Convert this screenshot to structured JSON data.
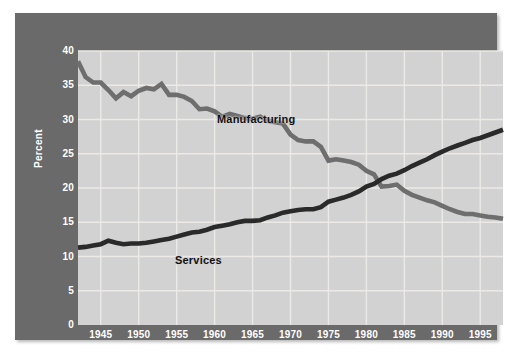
{
  "figure": {
    "background": "#ffffff",
    "frame_color": "#6a6a6a",
    "plot_background": "#d2d2d2",
    "grid_color": "#eceae6"
  },
  "chart_data": {
    "type": "line",
    "title": "",
    "subtitle": "",
    "xlabel": "",
    "ylabel": "Percent",
    "xlim": [
      1942,
      1998
    ],
    "ylim": [
      0,
      40
    ],
    "ytick_values": [
      0,
      5,
      10,
      15,
      20,
      25,
      30,
      35,
      40
    ],
    "ytick_labels": [
      "0",
      "5",
      "10",
      "15",
      "20",
      "25",
      "30",
      "35",
      "40"
    ],
    "xtick_values": [
      1945,
      1950,
      1955,
      1960,
      1965,
      1970,
      1975,
      1980,
      1985,
      1990,
      1995
    ],
    "xtick_labels": [
      "1945",
      "1950",
      "1955",
      "1960",
      "1965",
      "1970",
      "1975",
      "1980",
      "1985",
      "1990",
      "1995"
    ],
    "grid": true,
    "grid_axes": "both",
    "legend": "inline-annotations",
    "annotations": [
      {
        "text": "Manufacturing",
        "x": 1954,
        "y": 35.2
      },
      {
        "text": "Services",
        "x": 1947,
        "y": 14.6
      }
    ],
    "x": [
      1942,
      1943,
      1944,
      1945,
      1946,
      1947,
      1948,
      1949,
      1950,
      1951,
      1952,
      1953,
      1954,
      1955,
      1956,
      1957,
      1958,
      1959,
      1960,
      1961,
      1962,
      1963,
      1964,
      1965,
      1966,
      1967,
      1968,
      1969,
      1970,
      1971,
      1972,
      1973,
      1974,
      1975,
      1976,
      1977,
      1978,
      1979,
      1980,
      1981,
      1982,
      1983,
      1984,
      1985,
      1986,
      1987,
      1988,
      1989,
      1990,
      1991,
      1992,
      1993,
      1994,
      1995,
      1996,
      1997,
      1998
    ],
    "series": [
      {
        "name": "Manufacturing",
        "color": "#6e6e6e",
        "values": [
          38.5,
          36.2,
          35.4,
          35.4,
          34.3,
          33.1,
          34.0,
          33.4,
          34.2,
          34.6,
          34.4,
          35.2,
          33.6,
          33.6,
          33.3,
          32.7,
          31.5,
          31.6,
          31.2,
          30.4,
          30.8,
          30.5,
          30.2,
          30.1,
          30.4,
          29.8,
          29.6,
          29.4,
          27.8,
          27.0,
          26.8,
          26.8,
          26.0,
          24.0,
          24.2,
          24.0,
          23.8,
          23.4,
          22.5,
          22.0,
          20.2,
          20.3,
          20.5,
          19.6,
          19.0,
          18.6,
          18.2,
          17.9,
          17.4,
          16.9,
          16.5,
          16.2,
          16.2,
          16.0,
          15.8,
          15.7,
          15.5
        ]
      },
      {
        "name": "Services",
        "color": "#2a2a2a",
        "values": [
          11.3,
          11.4,
          11.6,
          11.8,
          12.3,
          12.0,
          11.8,
          11.9,
          11.9,
          12.0,
          12.2,
          12.4,
          12.6,
          12.9,
          13.2,
          13.5,
          13.6,
          13.9,
          14.3,
          14.5,
          14.7,
          15.0,
          15.2,
          15.2,
          15.3,
          15.7,
          16.0,
          16.4,
          16.6,
          16.8,
          16.9,
          16.9,
          17.2,
          18.0,
          18.3,
          18.6,
          19.0,
          19.5,
          20.2,
          20.6,
          21.3,
          21.8,
          22.1,
          22.6,
          23.2,
          23.7,
          24.2,
          24.8,
          25.3,
          25.8,
          26.2,
          26.6,
          27.0,
          27.3,
          27.7,
          28.1,
          28.5
        ]
      }
    ]
  }
}
